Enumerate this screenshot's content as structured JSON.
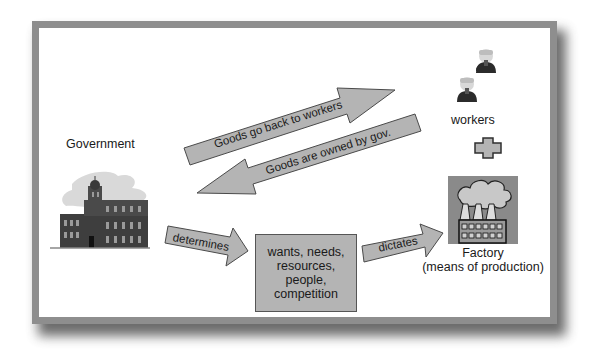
{
  "diagram": {
    "nodes": {
      "government": {
        "label": "Government",
        "icon": "government-building-icon"
      },
      "workers": {
        "label": "workers",
        "icon": "worker-person-icon",
        "count": 2
      },
      "plus": {
        "icon": "plus-icon"
      },
      "factory": {
        "label_line1": "Factory",
        "label_line2": "(means of production)",
        "icon": "factory-icon"
      },
      "factors_box": {
        "lines": [
          "wants, needs,",
          "resources,",
          "people,",
          "competition"
        ]
      }
    },
    "arrows": [
      {
        "id": "goods-back",
        "label": "Goods go back to workers",
        "from": "government",
        "to": "workers"
      },
      {
        "id": "goods-owned",
        "label": "Goods are owned by gov.",
        "from": "workers",
        "to": "government"
      },
      {
        "id": "determines",
        "label": "determines",
        "from": "government",
        "to": "factors_box"
      },
      {
        "id": "dictates",
        "label": "dictates",
        "from": "factors_box",
        "to": "factory"
      }
    ]
  },
  "colors": {
    "frame": "#8e8e8e",
    "arrow_fill": "#b4b4b4",
    "arrow_stroke": "#4a4a4a",
    "box_fill": "#b4b4b4",
    "text": "#1a1a1a"
  }
}
